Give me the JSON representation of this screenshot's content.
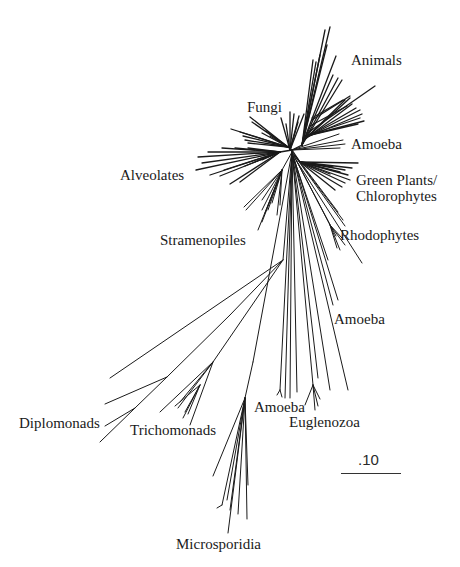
{
  "figure": {
    "type": "unrooted phylogenetic tree",
    "line_color": "#1a1a1a",
    "background": "#ffffff"
  },
  "labels": {
    "animals": "Animals",
    "fungi": "Fungi",
    "amoeba_top": "Amoeba",
    "alveolates": "Alveolates",
    "green_plants_line1": "Green Plants/",
    "green_plants_line2": "Chlorophytes",
    "stramenopiles": "Stramenopiles",
    "rhodophytes": "Rhodophytes",
    "amoeba_mid": "Amoeba",
    "diplomonads": "Diplomonads",
    "trichomonads": "Trichomonads",
    "amoeba_bottom": "Amoeba",
    "euglenozoa": "Euglenozoa",
    "microsporidia": "Microsporidia"
  },
  "scale": {
    "label": ".10"
  }
}
